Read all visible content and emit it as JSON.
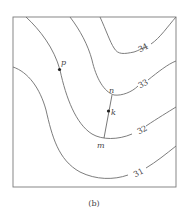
{
  "figure": {
    "caption": "(b)",
    "contours": [
      {
        "value": "34",
        "label": "34"
      },
      {
        "value": "33",
        "label": "33"
      },
      {
        "value": "32",
        "label": "32"
      },
      {
        "value": "31",
        "label": "31"
      }
    ],
    "points": {
      "p": "p",
      "n": "n",
      "k": "k",
      "m": "m"
    }
  }
}
